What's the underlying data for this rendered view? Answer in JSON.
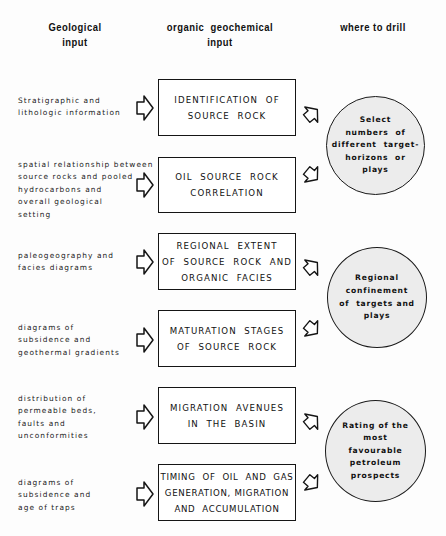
{
  "headers": {
    "geological": "Geological\ninput",
    "organic": "organic  geochemical\ninput",
    "drill": "where to drill"
  },
  "rows": [
    {
      "geological_input": "Stratigraphic and\nlithologic information",
      "geochemical_step": "IDENTIFICATION  OF\nSOURCE  ROCK"
    },
    {
      "geological_input": "spatial relationship between\nsource rocks and pooled\nhydrocarbons and\noverall geological\nsetting",
      "geochemical_step": "OIL  SOURCE  ROCK\nCORRELATION"
    },
    {
      "geological_input": "paleogeography and\nfacies diagrams",
      "geochemical_step": "REGIONAL  EXTENT\nOF  SOURCE  ROCK  AND\nORGANIC  FACIES"
    },
    {
      "geological_input": "diagrams of\nsubsidence and\ngeothermal gradients",
      "geochemical_step": "MATURATION  STAGES\nOF  SOURCE  ROCK"
    },
    {
      "geological_input": "distribution of\npermeable beds,\nfaults and\nunconformities",
      "geochemical_step": "MIGRATION  AVENUES\nIN  THE  BASIN"
    },
    {
      "geological_input": "diagrams of\nsubsidence and\nage of traps",
      "geochemical_step": "TIMING  OF  OIL  AND  GAS\nGENERATION, MIGRATION\nAND  ACCUMULATION"
    }
  ],
  "outcomes": [
    {
      "text": "Select\nnumbers  of\ndifferent  target-\nhorizons  or\nplays"
    },
    {
      "text": "Regional\nconfinement\nof  targets and\nplays"
    },
    {
      "text": "Rating of the\nmost\nfavourable\npetroleum\nprospects"
    }
  ],
  "colors": {
    "ink": "#151515",
    "circle_fill": "#ececec",
    "background": "#fdfdfd"
  },
  "icons": {
    "input_arrow": "block-arrow-right",
    "outcome_arrow": "block-arrow-diagonal"
  }
}
